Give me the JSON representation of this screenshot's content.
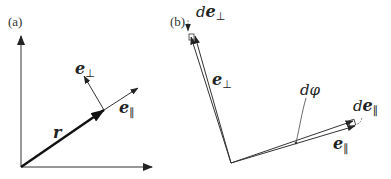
{
  "figure": {
    "panel_a": {
      "label": "(a)",
      "vectors": {
        "r": {
          "symbol": "r"
        },
        "e_perp": {
          "symbol": "e",
          "subscript": "⊥"
        },
        "e_par": {
          "symbol": "e",
          "subscript": "∥"
        }
      },
      "axes": [
        "x-axis",
        "y-axis"
      ]
    },
    "panel_b": {
      "label": "(b)",
      "vectors": {
        "e_perp": {
          "symbol": "e",
          "subscript": "⊥"
        },
        "e_par": {
          "symbol": "e",
          "subscript": "∥"
        },
        "de_perp": {
          "prefix": "d",
          "symbol": "e",
          "subscript": "⊥"
        },
        "de_par": {
          "prefix": "d",
          "symbol": "e",
          "subscript": "∥"
        }
      },
      "angle": {
        "label": "dφ"
      }
    },
    "colors": {
      "stroke": "#222222",
      "background": "#ffffff"
    }
  }
}
